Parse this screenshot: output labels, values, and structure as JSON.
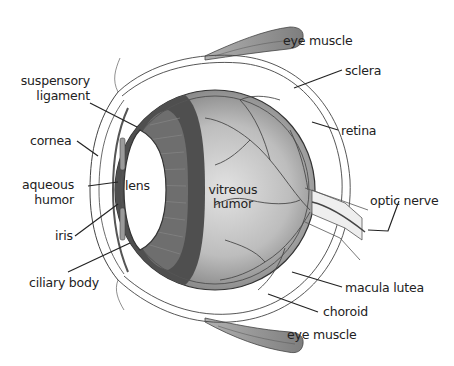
{
  "diagram": {
    "labels": {
      "eye_muscle_top": "eye muscle",
      "sclera": "sclera",
      "suspensory_ligament_1": "suspensory",
      "suspensory_ligament_2": "ligament",
      "retina": "retina",
      "cornea": "cornea",
      "lens": "lens",
      "vitreous_humor_1": "vitreous",
      "vitreous_humor_2": "humor",
      "aqueous_humor_1": "aqueous",
      "aqueous_humor_2": "humor",
      "optic_nerve": "optic nerve",
      "iris": "iris",
      "ciliary_body": "ciliary body",
      "macula_lutea": "macula lutea",
      "choroid": "choroid",
      "eye_muscle_bottom": "eye muscle"
    },
    "colors": {
      "outline": "#333333",
      "muscle": "#8a8a8a",
      "iris_band_dark": "#4a4a4a",
      "vitreous_center": "#d8d8d8",
      "vitreous_edge": "#6e6e6e",
      "lens": "#ffffff"
    }
  }
}
